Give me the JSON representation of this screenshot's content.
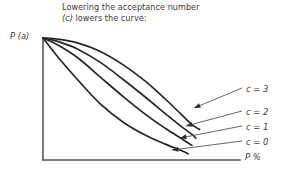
{
  "caption": {
    "line1": "Lowering the acceptance number",
    "line2_italic": "(c)",
    "line2_rest": " lowers the curve:",
    "full": "Lowering the acceptance number\n(c)  lowers the curve:"
  },
  "axes": {
    "y_label": "P (a)",
    "x_label": "P %",
    "origin_px": [
      43,
      160
    ],
    "y_top_px": 38,
    "x_right_px": 240,
    "axis_color": "#555555"
  },
  "curve_labels": [
    {
      "text": "c = 3",
      "x": 246,
      "y": 84
    },
    {
      "text": "c = 2",
      "x": 246,
      "y": 107
    },
    {
      "text": "c = 1",
      "x": 246,
      "y": 122
    },
    {
      "text": "c = 0",
      "x": 246,
      "y": 137
    }
  ],
  "chart_data": {
    "type": "line",
    "xlabel": "P %",
    "ylabel": "P (a)",
    "grid": false,
    "legend_position": "right-inline-annotations",
    "xlim": [
      0,
      100
    ],
    "ylim": [
      0,
      1
    ],
    "note": "Operating characteristic (OC) curves; all four start at P(a)=1 at P%=0 and fall monotonically. Lower acceptance number c gives a lower curve.",
    "series": [
      {
        "name": "c = 3",
        "color": "#262626",
        "label_anchor": [
          246,
          84
        ],
        "arrow_tip": [
          194,
          108
        ],
        "x": [
          0,
          8,
          18,
          30,
          42,
          54,
          64,
          72,
          78,
          82
        ],
        "y": [
          1.0,
          0.99,
          0.96,
          0.89,
          0.78,
          0.64,
          0.5,
          0.38,
          0.29,
          0.25
        ]
      },
      {
        "name": "c = 2",
        "color": "#262626",
        "label_anchor": [
          246,
          107
        ],
        "arrow_tip": [
          186,
          126
        ],
        "x": [
          0,
          8,
          18,
          30,
          42,
          54,
          64,
          72,
          78,
          80
        ],
        "y": [
          1.0,
          0.97,
          0.91,
          0.8,
          0.66,
          0.51,
          0.38,
          0.28,
          0.21,
          0.18
        ]
      },
      {
        "name": "c = 1",
        "color": "#262626",
        "label_anchor": [
          246,
          122
        ],
        "arrow_tip": [
          180,
          138
        ],
        "x": [
          0,
          8,
          18,
          30,
          42,
          54,
          64,
          72,
          76,
          78
        ],
        "y": [
          1.0,
          0.94,
          0.84,
          0.68,
          0.52,
          0.37,
          0.26,
          0.18,
          0.14,
          0.12
        ]
      },
      {
        "name": "c = 0",
        "color": "#262626",
        "label_anchor": [
          246,
          137
        ],
        "arrow_tip": [
          172,
          150
        ],
        "x": [
          0,
          8,
          18,
          30,
          42,
          54,
          64,
          72,
          75,
          76
        ],
        "y": [
          1.0,
          0.84,
          0.66,
          0.46,
          0.31,
          0.2,
          0.13,
          0.08,
          0.06,
          0.05
        ]
      }
    ]
  }
}
